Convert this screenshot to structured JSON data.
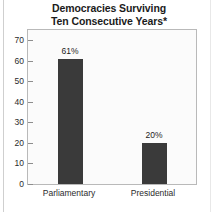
{
  "chart_data": {
    "type": "bar",
    "title": "Democracies Surviving Ten Consecutive Years*",
    "title_lines": [
      "Democracies Surviving",
      "Ten Consecutive Years*"
    ],
    "categories": [
      "Parliamentary",
      "Presidential"
    ],
    "values": [
      61,
      20
    ],
    "value_labels": [
      "61%",
      "20%"
    ],
    "xlabel": "",
    "ylabel": "",
    "ylim": [
      0,
      75
    ],
    "yticks": [
      0,
      10,
      20,
      30,
      40,
      50,
      60,
      70
    ],
    "ytick_labels": [
      "0",
      "10",
      "20",
      "30",
      "40",
      "50",
      "60",
      "70"
    ],
    "grid": false,
    "legend": false,
    "bar_color": "#3a3a3a",
    "plot_background": "#fbfbfb",
    "frame_color": "#b9b9b9",
    "text_color": "#1b1b1b"
  }
}
